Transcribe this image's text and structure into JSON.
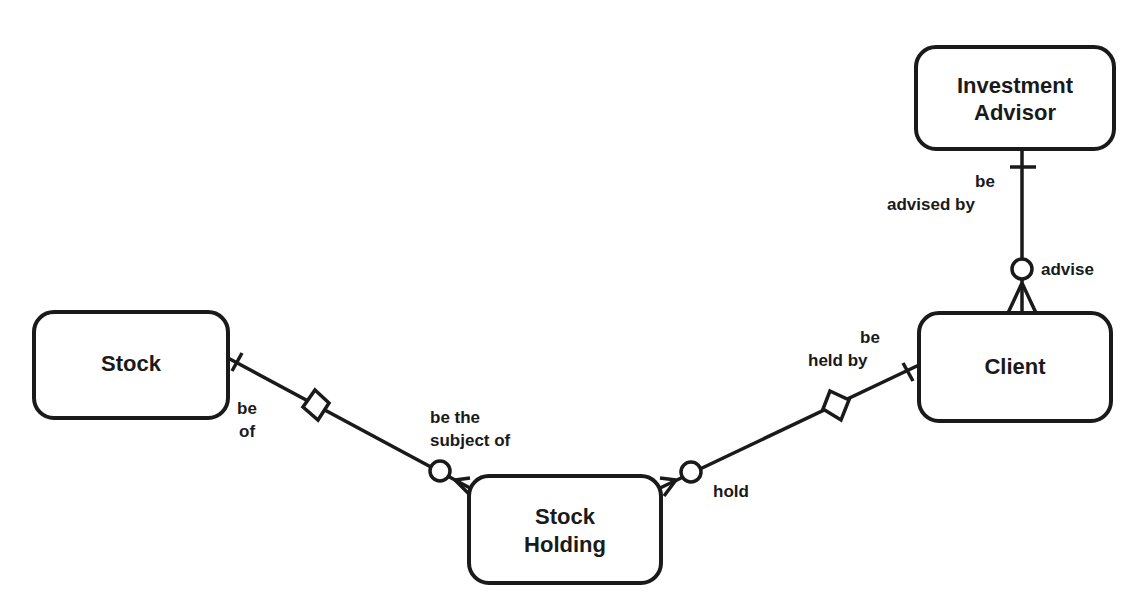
{
  "diagram": {
    "type": "entity-relationship",
    "entities": [
      {
        "id": "investment-advisor",
        "lines": [
          "Investment",
          "Advisor"
        ],
        "x": 916,
        "y": 47,
        "w": 198,
        "h": 102
      },
      {
        "id": "stock",
        "lines": [
          "Stock"
        ],
        "x": 34,
        "y": 312,
        "w": 194,
        "h": 106
      },
      {
        "id": "client",
        "lines": [
          "Client"
        ],
        "x": 919,
        "y": 313,
        "w": 192,
        "h": 108
      },
      {
        "id": "stock-holding",
        "lines": [
          "Stock",
          "Holding"
        ],
        "x": 469,
        "y": 476,
        "w": 192,
        "h": 107
      }
    ],
    "relationships": [
      {
        "id": "advisor-client",
        "from": "investment-advisor",
        "to": "client",
        "from_label": [
          "be",
          "advised by"
        ],
        "to_label": [
          "advise"
        ],
        "from_cardinality": "one (mandatory)",
        "to_cardinality": "zero-or-many (optional)"
      },
      {
        "id": "stock-holding-stock",
        "from": "stock",
        "to": "stock-holding",
        "from_label": [
          "be",
          "of"
        ],
        "to_label": [
          "be the",
          "subject of"
        ],
        "from_cardinality": "one (mandatory, identifying)",
        "to_cardinality": "zero-or-many (optional)"
      },
      {
        "id": "client-stock-holding",
        "from": "client",
        "to": "stock-holding",
        "from_label": [
          "be",
          "held by"
        ],
        "to_label": [
          "hold"
        ],
        "from_cardinality": "one (mandatory, identifying)",
        "to_cardinality": "zero-or-many (optional)"
      }
    ],
    "colors": {
      "stroke": "#1a1a1a",
      "background": "#ffffff"
    }
  }
}
